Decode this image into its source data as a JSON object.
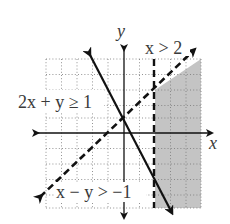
{
  "diagram": {
    "type": "system-of-inequalities-graph",
    "axes": {
      "x_label": "x",
      "y_label": "y"
    },
    "grid": {
      "x_range": [
        -5,
        5
      ],
      "y_range": [
        -5,
        5
      ],
      "unit_px": 15.5
    },
    "inequalities": [
      {
        "label": "x > 2",
        "boundary": "x = 2",
        "style": "dashed"
      },
      {
        "label": "2x + y ≥ 1",
        "boundary": "2x + y = 1",
        "style": "solid"
      },
      {
        "label": "x − y > −1",
        "boundary": "x - y = -1",
        "style": "dashed"
      }
    ],
    "shaded_region": "solution set of the system (right of x = 2, below x − y = −1)",
    "colors": {
      "shade": "#c4c4c4",
      "line": "#111111",
      "grid": "#777777"
    }
  }
}
